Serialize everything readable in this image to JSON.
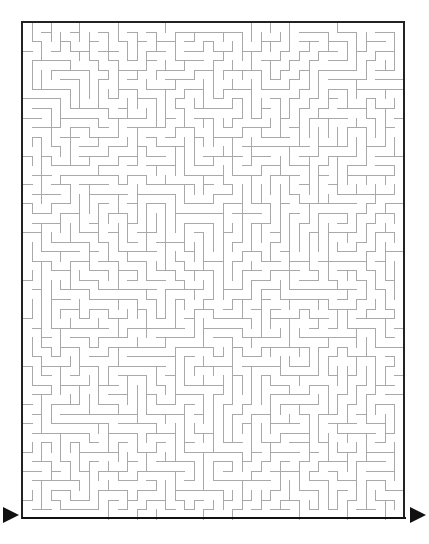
{
  "page": {
    "title": "Maze Puzzle",
    "background_color": "#ffffff",
    "width": 429,
    "height": 544
  },
  "maze": {
    "name": "rectangular-perfect-maze",
    "kind": "printable-puzzle",
    "columns": 40,
    "rows": 52,
    "cell_size": 9.55,
    "origin_x": 22,
    "origin_y": 22,
    "grid_width": 382,
    "grid_height": 496,
    "wall_color": "#a9a9a9",
    "border_color": "#222222",
    "baseline_color": "#111111",
    "wall_thickness": 1,
    "border_thickness": 2,
    "seed": 20240517,
    "alt_text": "A dense rectangular maze of thin gray walls enclosed by a dark rectangular border, with black triangular arrow markers at the lower left and lower right indicating the entrance and the exit."
  },
  "markers": {
    "entrance": {
      "label": "Entrance",
      "icon": "triangle-right-icon",
      "x": 3,
      "y": 507,
      "width": 16,
      "height": 16,
      "color": "#111111"
    },
    "exit": {
      "label": "Exit",
      "icon": "triangle-right-icon",
      "x": 410,
      "y": 507,
      "width": 16,
      "height": 16,
      "color": "#111111"
    }
  },
  "baseline": {
    "name": "bottom-rule",
    "x1": 22,
    "x2": 406,
    "y": 518,
    "color": "#111111"
  }
}
